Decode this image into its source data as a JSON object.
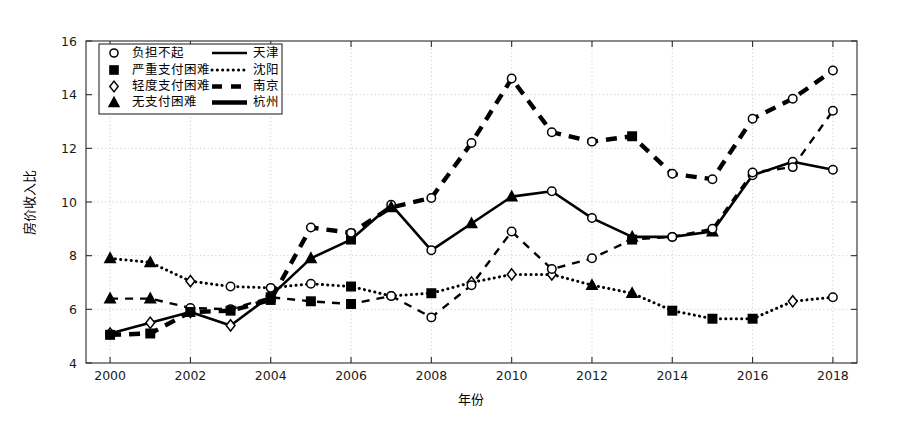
{
  "chart_data": {
    "type": "line",
    "title": "",
    "xlabel": "年份",
    "ylabel": "房价收入比",
    "grid": true,
    "legend_position": "upper-left-inside",
    "x": [
      2000,
      2001,
      2002,
      2003,
      2004,
      2005,
      2006,
      2007,
      2008,
      2009,
      2010,
      2011,
      2012,
      2013,
      2014,
      2015,
      2016,
      2017,
      2018
    ],
    "xticks": [
      2000,
      2002,
      2004,
      2006,
      2008,
      2010,
      2012,
      2014,
      2016,
      2018
    ],
    "xtick_labels": [
      "2000",
      "2002",
      "2004",
      "2006",
      "2008",
      "2010",
      "2012",
      "2014",
      "2016",
      "2018"
    ],
    "xlim": [
      1999.4,
      2018.6
    ],
    "yticks": [
      4,
      6,
      8,
      10,
      12,
      14,
      16
    ],
    "ytick_labels": [
      "4",
      "6",
      "8",
      "10",
      "12",
      "14",
      "16"
    ],
    "ylim": [
      4,
      16
    ],
    "series": [
      {
        "name": "天津",
        "city": "天津",
        "linestyle": "solid-thick",
        "color": "#000000",
        "values": [
          5.1,
          5.5,
          5.9,
          5.4,
          6.5,
          7.9,
          8.6,
          9.9,
          8.2,
          9.2,
          10.2,
          10.4,
          9.4,
          8.7,
          8.7,
          8.9,
          11.0,
          11.5,
          11.2
        ],
        "markers": [
          "轻度支付困难",
          "轻度支付困难",
          "轻度支付困难",
          "轻度支付困难",
          "轻度支付困难",
          "无支付困难",
          "严重支付困难",
          "负担不起",
          "负担不起",
          "无支付困难",
          "无支付困难",
          "负担不起",
          "负担不起",
          "无支付困难",
          "负担不起",
          "无支付困难",
          "负担不起",
          "负担不起",
          "负担不起"
        ]
      },
      {
        "name": "沈阳",
        "city": "沈阳",
        "linestyle": "dotted",
        "color": "#000000",
        "values": [
          7.9,
          7.75,
          7.05,
          6.85,
          6.8,
          6.95,
          6.85,
          6.5,
          6.6,
          7.0,
          7.3,
          7.3,
          6.9,
          6.6,
          5.95,
          5.65,
          5.65,
          6.3,
          6.45
        ],
        "markers": [
          "无支付困难",
          "无支付困难",
          "轻度支付困难",
          "负担不起",
          "负担不起",
          "负担不起",
          "严重支付困难",
          "负担不起",
          "严重支付困难",
          "轻度支付困难",
          "轻度支付困难",
          "轻度支付困难",
          "无支付困难",
          "无支付困难",
          "严重支付困难",
          "严重支付困难",
          "严重支付困难",
          "轻度支付困难",
          "负担不起"
        ]
      },
      {
        "name": "南京",
        "city": "南京",
        "linestyle": "dashed-thin",
        "color": "#000000",
        "values": [
          6.4,
          6.4,
          6.05,
          6.0,
          6.45,
          6.3,
          6.2,
          6.5,
          5.7,
          6.9,
          8.9,
          7.5,
          7.9,
          8.6,
          8.7,
          9.0,
          11.1,
          11.3,
          13.4
        ],
        "markers": [
          "无支付困难",
          "无支付困难",
          "负担不起",
          "负担不起",
          "严重支付困难",
          "严重支付困难",
          "严重支付困难",
          "负担不起",
          "负担不起",
          "负担不起",
          "负担不起",
          "负担不起",
          "负担不起",
          "严重支付困难",
          "负担不起",
          "负担不起",
          "负担不起",
          "负担不起",
          "负担不起"
        ]
      },
      {
        "name": "杭州",
        "city": "杭州",
        "linestyle": "dashed-thick",
        "color": "#000000",
        "values": [
          5.05,
          5.1,
          5.9,
          5.95,
          6.35,
          9.05,
          8.85,
          9.8,
          10.15,
          12.2,
          14.6,
          12.6,
          12.25,
          12.45,
          11.05,
          10.85,
          13.1,
          13.85,
          14.9
        ],
        "markers": [
          "严重支付困难",
          "严重支付困难",
          "严重支付困难",
          "严重支付困难",
          "严重支付困难",
          "负担不起",
          "负担不起",
          "无支付困难",
          "负担不起",
          "负担不起",
          "负担不起",
          "负担不起",
          "负担不起",
          "严重支付困难",
          "负担不起",
          "负担不起",
          "负担不起",
          "负担不起",
          "负担不起"
        ]
      }
    ]
  },
  "legend": {
    "marker_rows": [
      {
        "marker": "circle-open",
        "label": "负担不起"
      },
      {
        "marker": "square-filled",
        "label": "严重支付困难"
      },
      {
        "marker": "diamond-open",
        "label": "轻度支付困难"
      },
      {
        "marker": "triangle-filled",
        "label": "无支付困难"
      }
    ],
    "line_rows": [
      {
        "linestyle": "solid-thick",
        "label": "天津"
      },
      {
        "linestyle": "dotted",
        "label": "沈阳"
      },
      {
        "linestyle": "dashed-thick-short",
        "label": "南京"
      },
      {
        "linestyle": "solid-thick-short",
        "label": "杭州"
      }
    ]
  },
  "axes": {
    "x_title": "年份",
    "y_title": "房价收入比"
  }
}
